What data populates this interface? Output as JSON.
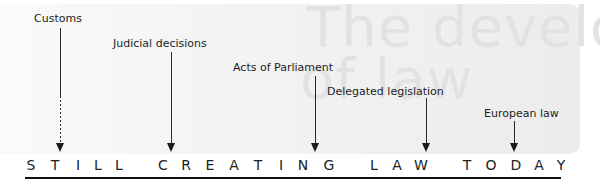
{
  "watermark": {
    "line1": "The development",
    "line2": "of law"
  },
  "sources": [
    {
      "label": "Customs",
      "style": "dashed"
    },
    {
      "label": "Judicial decisions",
      "style": "solid"
    },
    {
      "label": "Acts of Parliament",
      "style": "solid"
    },
    {
      "label": "Delegated legislation",
      "style": "solid"
    },
    {
      "label": "European law",
      "style": "solid"
    }
  ],
  "tagline": {
    "text": "STILL CREATING LAW TODAY",
    "letters": [
      "S",
      "T",
      "I",
      "L",
      "L",
      "C",
      "R",
      "E",
      "A",
      "T",
      "I",
      "N",
      "G",
      "L",
      "A",
      "W",
      "T",
      "O",
      "D",
      "A",
      "Y"
    ]
  },
  "colors": {
    "ink": "#1a1a1a",
    "panel": "#efefef",
    "watermark": "#e2e2e2"
  }
}
